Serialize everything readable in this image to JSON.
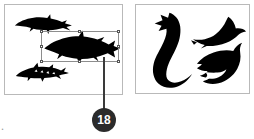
{
  "figure": {
    "callout": {
      "number": "18",
      "badge_color": "#2b2b2b",
      "text_color": "#ffffff",
      "leader_color": "#3a3a3a"
    },
    "corner_mark": "."
  },
  "panels": [
    {
      "id": "sharks",
      "name": "shark-silhouettes-panel",
      "border_color": "#b9b9b9",
      "background": "#ffffff",
      "shapes": [
        {
          "name": "shark-silhouette-top",
          "label": "slender shark silhouette",
          "fill": "#000000",
          "selected": "false"
        },
        {
          "name": "shark-silhouette-middle",
          "label": "large shark silhouette",
          "fill": "#000000",
          "selected": "true"
        },
        {
          "name": "shark-silhouette-bottom",
          "label": "sawshark silhouette",
          "fill": "#000000",
          "selected": "false"
        }
      ]
    },
    {
      "id": "dolphins",
      "name": "dolphin-silhouettes-panel",
      "border_color": "#b9b9b9",
      "background": "#ffffff",
      "shapes": [
        {
          "name": "dolphin-silhouette-left",
          "label": "curved diving dolphin silhouette",
          "fill": "#000000",
          "selected": "false"
        },
        {
          "name": "dolphin-silhouette-top-right",
          "label": "leaping dolphin silhouette",
          "fill": "#000000",
          "selected": "false"
        },
        {
          "name": "dolphin-silhouette-bottom-right",
          "label": "swimming dolphin silhouette",
          "fill": "#000000",
          "selected": "false"
        }
      ]
    }
  ],
  "selection": {
    "name": "selection-bounding-box",
    "stroke": "#8d8d8d",
    "handle_fill": "#ffffff",
    "handle_stroke": "#555555",
    "handles": [
      "top-left",
      "top-center",
      "top-right",
      "middle-left",
      "middle-right",
      "bottom-left",
      "bottom-center",
      "bottom-right"
    ]
  }
}
